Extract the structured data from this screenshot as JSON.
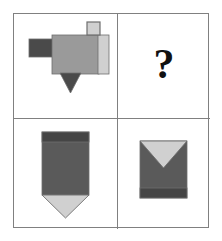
{
  "puzzle": {
    "type": "visual-analogy-matrix",
    "grid": {
      "rows": 2,
      "columns": 2
    },
    "frame": {
      "border_color": "#808080",
      "background_color": "#ffffff"
    },
    "palette": {
      "dark_gray": "#4a4a4a",
      "medium_dark_gray": "#5a5a5a",
      "medium_gray": "#9a9a9a",
      "light_gray": "#d0d0d0",
      "outline_gray": "#6e6e6e",
      "band_gray": "#454545",
      "black": "#111111",
      "white": "#ffffff"
    },
    "cells": [
      {
        "position": "top-left",
        "name": "banner-shape-rotated",
        "description": "Banner shape rotated 90 degrees counter-clockwise: light gray point strip on right, dark band on left, dark tab protruding left, small light square on top, dark triangle pointing down",
        "is_answer_slot": false,
        "parts": [
          {
            "name": "left-tab",
            "shape": "rectangle",
            "color": "#4a4a4a"
          },
          {
            "name": "body",
            "shape": "rectangle",
            "color": "#9a9a9a"
          },
          {
            "name": "point-strip",
            "shape": "rectangle",
            "color": "#d0d0d0"
          },
          {
            "name": "top-square",
            "shape": "square",
            "color": "#d0d0d0"
          },
          {
            "name": "down-triangle",
            "shape": "triangle",
            "color": "#4a4a4a"
          }
        ]
      },
      {
        "position": "top-right",
        "name": "answer-slot",
        "description": "Unknown cell marked with a question mark",
        "is_answer_slot": true,
        "marker": "?",
        "parts": []
      },
      {
        "position": "bottom-left",
        "name": "banner-shape-upright",
        "description": "Upright pennant: dark band across the top, medium dark gray body, light gray triangle pointing down at the bottom",
        "is_answer_slot": false,
        "parts": [
          {
            "name": "top-band",
            "shape": "rectangle",
            "color": "#454545"
          },
          {
            "name": "body",
            "shape": "rectangle",
            "color": "#5a5a5a"
          },
          {
            "name": "down-triangle",
            "shape": "triangle",
            "color": "#d0d0d0"
          }
        ]
      },
      {
        "position": "bottom-right",
        "name": "banner-shape-inverted",
        "description": "Pennant flipped vertically: light gray triangle notch pointing down from the top edge, medium dark gray body, dark band across the bottom",
        "is_answer_slot": false,
        "parts": [
          {
            "name": "top-triangle-notch",
            "shape": "triangle",
            "color": "#d0d0d0"
          },
          {
            "name": "body",
            "shape": "rectangle",
            "color": "#5a5a5a"
          },
          {
            "name": "bottom-band",
            "shape": "rectangle",
            "color": "#454545"
          }
        ]
      }
    ]
  }
}
